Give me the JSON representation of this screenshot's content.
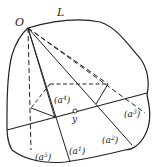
{
  "diagram": {
    "labels": {
      "origin": "O",
      "curve": "L",
      "point": "y",
      "a1": "(a",
      "a1_sup": "1",
      "a2": "(a",
      "a2_sup": "2",
      "a3": "(a",
      "a3_sup": "3",
      "a4": "(a",
      "a4_sup": "4",
      "a5": "(a",
      "a5_sup": "5",
      "close": ")"
    },
    "colors": {
      "stroke": "#222222",
      "background": "#ffffff"
    }
  }
}
